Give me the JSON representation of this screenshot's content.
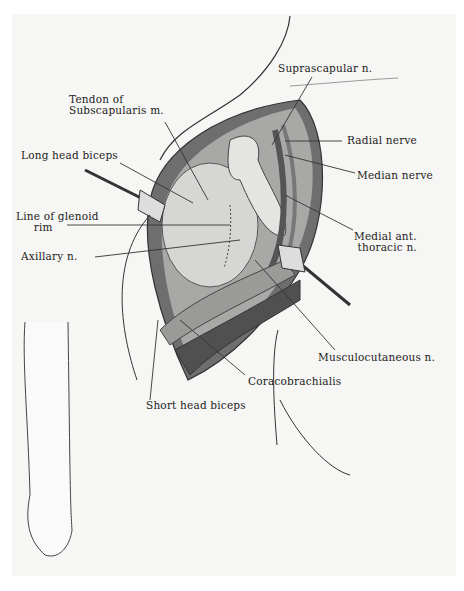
{
  "figure": {
    "colors": {
      "background": "#f6f6f4",
      "ink": "#222222",
      "tissue_dark": "#3a3a3a",
      "tissue_mid": "#8a8a8a",
      "tissue_light": "#d8d8d6"
    }
  },
  "labels": {
    "suprascapular": "Suprascapular n.",
    "tendon_subscap": "Tendon of\nSubscapularis m.",
    "radial": "Radial nerve",
    "long_head_biceps": "Long head biceps",
    "median": "Median nerve",
    "glenoid": "Line of glenoid\n     rim",
    "medial_ant_thoracic": "Medial ant.\n thoracic n.",
    "axillary": "Axillary n.",
    "musculocutaneous": "Musculocutaneous n.",
    "coracobrachialis": "Coracobrachialis",
    "short_head_biceps": "Short head biceps"
  }
}
